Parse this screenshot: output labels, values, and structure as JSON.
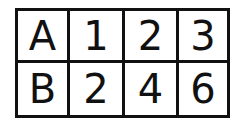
{
  "table": {
    "rows": [
      [
        "A",
        "1",
        "2",
        "3"
      ],
      [
        "B",
        "2",
        "4",
        "6"
      ]
    ]
  }
}
